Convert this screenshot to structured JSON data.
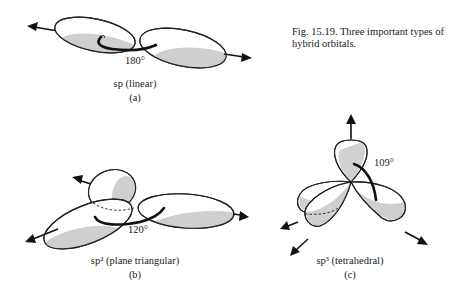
{
  "caption": {
    "figure_number": "Fig. 15.19.",
    "text": "Three important types of hybrid orbitals.",
    "full": "Fig. 15.19.  Three important types of hybrid orbitals."
  },
  "panels": [
    {
      "id": "a",
      "hybrid": "sp",
      "geometry": "linear",
      "label": "sp (linear)",
      "letter": "(a)",
      "angle": "180°",
      "lobes": 2
    },
    {
      "id": "b",
      "hybrid": "sp²",
      "geometry": "plane triangular",
      "label": "sp² (plane triangular)",
      "letter": "(b)",
      "angle": "120°",
      "lobes": 3
    },
    {
      "id": "c",
      "hybrid": "sp³",
      "geometry": "tetrahedral",
      "label": "sp³ (tetrahedral)",
      "letter": "(c)",
      "angle": "109°",
      "lobes": 4
    }
  ],
  "colors": {
    "lobe_fill": "#ffffff",
    "shade": "#cfcfcf",
    "ink": "#111111"
  }
}
